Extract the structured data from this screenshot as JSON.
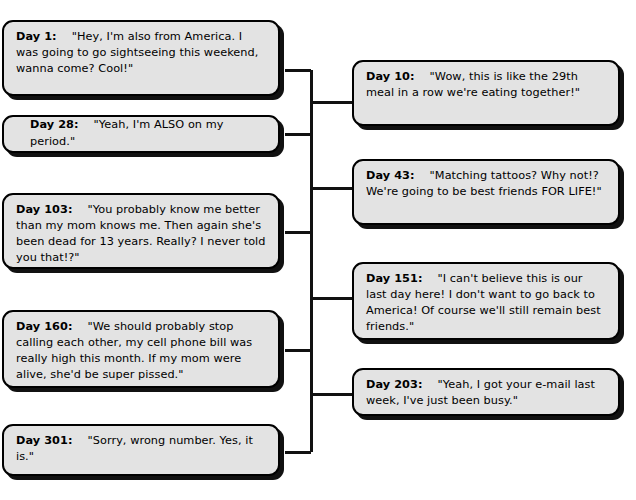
{
  "diagram": {
    "type": "bracket-tree",
    "background_color": "#ffffff",
    "box_fill_color": "#e3e3e3",
    "box_border_color": "#000000",
    "connector_color": "#111111",
    "title": ""
  },
  "left_column": [
    {
      "id": "day-1",
      "day_label": "Day 1:",
      "quote": "\"Hey, I'm also from America. I was going to go sightseeing this weekend, wanna come? Cool!\""
    },
    {
      "id": "day-28",
      "day_label": "Day 28:",
      "quote": "\"Yeah, I'm ALSO on my period.\""
    },
    {
      "id": "day-103",
      "day_label": "Day 103:",
      "quote": "\"You probably know me better than my mom knows me. Then again she's been dead for 13 years. Really? I never told you that!?\""
    },
    {
      "id": "day-160",
      "day_label": "Day 160:",
      "quote": "\"We should probably stop calling each other, my cell phone bill was really high this month. If my mom were alive, she'd be super pissed.\""
    },
    {
      "id": "day-301",
      "day_label": "Day 301:",
      "quote": "\"Sorry, wrong number. Yes, it is.\""
    }
  ],
  "right_column": [
    {
      "id": "day-10",
      "day_label": "Day 10:",
      "quote": "\"Wow, this is like the 29th meal in a row we're eating together!\""
    },
    {
      "id": "day-43",
      "day_label": "Day 43:",
      "quote": "\"Matching tattoos? Why not!? We're going to be best friends FOR LIFE!\""
    },
    {
      "id": "day-151",
      "day_label": "Day 151:",
      "quote": "\"I can't believe this is our last day here! I don't want to go back to America! Of course we'll still remain best friends.\""
    },
    {
      "id": "day-203",
      "day_label": "Day 203:",
      "quote": "\"Yeah, I got your e-mail last week, I've just been busy.\""
    }
  ]
}
